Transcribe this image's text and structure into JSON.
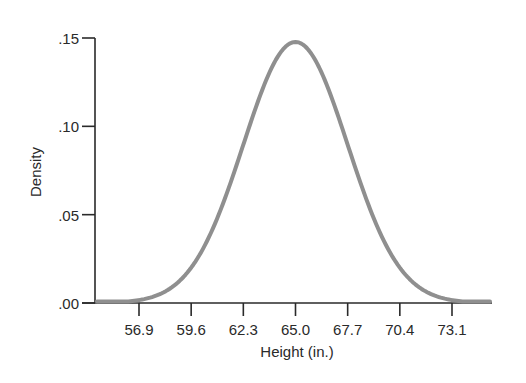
{
  "chart_data": {
    "type": "line",
    "title": "",
    "xlabel": "Height (in.)",
    "ylabel": "Density",
    "distribution": {
      "name": "normal",
      "mean": 65.0,
      "sd": 2.7
    },
    "x_ticks": [
      "56.9",
      "59.6",
      "62.3",
      "65.0",
      "67.7",
      "70.4",
      "73.1"
    ],
    "x_tick_values": [
      56.9,
      59.6,
      62.3,
      65.0,
      67.7,
      70.4,
      73.1
    ],
    "y_ticks": [
      ".00",
      ".05",
      ".10",
      ".15"
    ],
    "y_tick_values": [
      0.0,
      0.05,
      0.1,
      0.15
    ],
    "xlim": [
      54.0,
      75.9
    ],
    "ylim": [
      0.0,
      0.15
    ],
    "grid": false,
    "legend": null,
    "series": [
      {
        "name": "Normal density",
        "x": [
          54.8,
          56.9,
          59.6,
          62.3,
          65.0,
          67.7,
          70.4,
          73.1,
          75.2
        ],
        "values": [
          0.0012,
          0.0045,
          0.02,
          0.0896,
          0.1478,
          0.0896,
          0.02,
          0.0045,
          0.0012
        ]
      }
    ],
    "colors": {
      "curve": "#8f8f8f",
      "axis": "#2a2a2a"
    }
  }
}
